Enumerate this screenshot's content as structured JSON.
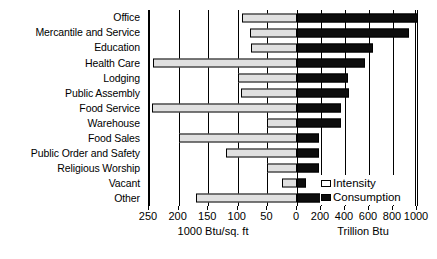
{
  "chart_data": {
    "type": "bar",
    "title": "",
    "subtitle": "",
    "orientation": "horizontal",
    "style": "bidirectional-tornado",
    "grid": true,
    "legend_position": "bottom-right",
    "categories": [
      "Office",
      "Mercantile and Service",
      "Education",
      "Health Care",
      "Lodging",
      "Public Assembly",
      "Food Service",
      "Warehouse",
      "Food Sales",
      "Public Order and Safety",
      "Religious Worship",
      "Vacant",
      "Other"
    ],
    "series": [
      {
        "name": "Intensity",
        "units": "1000 Btu/sq. ft",
        "direction": "left",
        "axis_max": 250,
        "values": [
          93,
          80,
          78,
          243,
          100,
          95,
          245,
          50,
          200,
          120,
          50,
          25,
          170
        ]
      },
      {
        "name": "Consumption",
        "units": "Trillion Btu",
        "direction": "right",
        "axis_max": 1000,
        "values": [
          1010,
          930,
          630,
          570,
          425,
          430,
          370,
          370,
          180,
          180,
          180,
          75,
          215
        ]
      }
    ],
    "left_axis": {
      "label": "1000 Btu/sq. ft",
      "ticks": [
        250,
        200,
        150,
        100,
        50,
        0
      ],
      "range": [
        250,
        0
      ]
    },
    "right_axis": {
      "label": "Trillion Btu",
      "ticks": [
        0,
        200,
        400,
        600,
        800,
        1000
      ],
      "range": [
        0,
        1000
      ]
    },
    "legend": [
      {
        "label": "Intensity",
        "color": "#ffffff",
        "swatch": "outlined-light"
      },
      {
        "label": "Consumption",
        "color": "#0d0d0d",
        "swatch": "solid-black"
      }
    ]
  }
}
